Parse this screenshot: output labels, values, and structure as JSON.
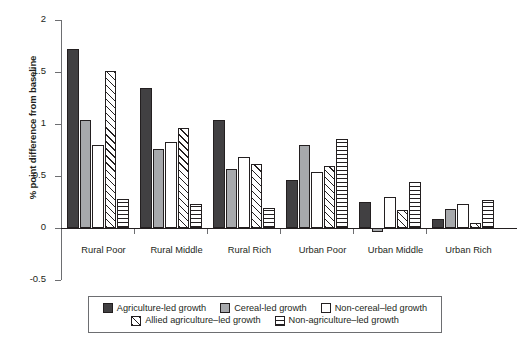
{
  "chart_data": {
    "type": "bar",
    "title": "",
    "xlabel": "",
    "ylabel": "% point difference from baseline",
    "ylim": [
      -0.5,
      2
    ],
    "yticks": [
      2,
      1.5,
      1,
      0.5,
      0,
      -0.5
    ],
    "ytick_labels": [
      "2",
      "1.5",
      "1",
      "0.5",
      "0",
      "-0.5"
    ],
    "grid": false,
    "legend_position": "bottom",
    "categories": [
      "Rural Poor",
      "Rural Middle",
      "Rural Rich",
      "Urban Poor",
      "Urban Middle",
      "Urban Rich"
    ],
    "series": [
      {
        "name": "Agriculture-led growth",
        "fill": "solid-dark",
        "color": "#414042",
        "values": [
          1.72,
          1.35,
          1.04,
          0.46,
          0.25,
          0.09
        ]
      },
      {
        "name": "Cereal-led growth",
        "fill": "solid-gray",
        "color": "#a7a9ac",
        "values": [
          1.04,
          0.76,
          0.57,
          0.8,
          -0.04,
          0.18
        ]
      },
      {
        "name": "Non-cereal–led growth",
        "fill": "white",
        "color": "#ffffff",
        "values": [
          0.8,
          0.83,
          0.68,
          0.54,
          0.3,
          0.23
        ]
      },
      {
        "name": "Allied agriculture–led growth",
        "fill": "diagonal-hatch",
        "color": "#ffffff",
        "values": [
          1.51,
          0.96,
          0.62,
          0.6,
          0.17,
          0.05
        ]
      },
      {
        "name": "Non-agriculture–led growth",
        "fill": "horizontal-hatch",
        "color": "#ffffff",
        "values": [
          0.28,
          0.23,
          0.19,
          0.86,
          0.44,
          0.27
        ]
      }
    ]
  },
  "legend": {
    "rows": [
      [
        0,
        1,
        2
      ],
      [
        3,
        4
      ]
    ]
  }
}
